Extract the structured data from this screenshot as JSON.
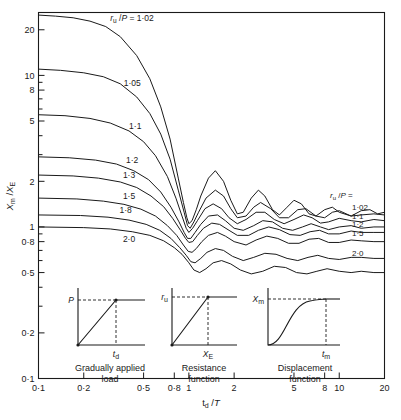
{
  "chart_data": {
    "type": "line",
    "title": "",
    "xlabel": "t_d /T",
    "ylabel": "X_m /X_E",
    "xscale": "log",
    "yscale": "log",
    "xlim": [
      0.1,
      20
    ],
    "ylim": [
      0.1,
      26
    ],
    "grid": false,
    "legend_position": "right",
    "legend_title": "r_u /P =",
    "xticks": [
      "0·1",
      "0·2",
      "0·5",
      "0·8",
      "1",
      "2",
      "5",
      "8",
      "10",
      "20"
    ],
    "xtick_values": [
      0.1,
      0.2,
      0.5,
      0.8,
      1,
      2,
      5,
      8,
      10,
      20
    ],
    "yticks": [
      "0·1",
      "0·2",
      "0·5",
      "0·8",
      "1",
      "2",
      "5",
      "8",
      "10",
      "20"
    ],
    "ytick_values": [
      0.1,
      0.2,
      0.5,
      0.8,
      1,
      2,
      5,
      8,
      10,
      20
    ],
    "series": [
      {
        "name": "1·02",
        "inner_label": "r_u /P = 1·02",
        "right_label": "1·02",
        "plateau": 1.25,
        "x": [
          0.1,
          0.13,
          0.17,
          0.22,
          0.28,
          0.35,
          0.45,
          0.55,
          0.65,
          0.75,
          0.85,
          0.92,
          0.97,
          1.0,
          1.05,
          1.12,
          1.2,
          1.35,
          1.5,
          1.7,
          1.9,
          2.1,
          2.3,
          2.6,
          2.9,
          3.2,
          3.6,
          4.0,
          4.5,
          5.0,
          5.6,
          6.3,
          7.0,
          8.0,
          9.0,
          10.0,
          12.0,
          14.0,
          16.0,
          18.0,
          20.0
        ],
        "y": [
          25.0,
          24.6,
          24.0,
          22.8,
          21.0,
          18.0,
          13.5,
          9.5,
          6.2,
          3.8,
          2.1,
          1.45,
          1.15,
          1.05,
          1.1,
          1.3,
          1.6,
          2.1,
          2.35,
          2.0,
          1.5,
          1.22,
          1.25,
          1.55,
          1.75,
          1.6,
          1.3,
          1.2,
          1.35,
          1.5,
          1.42,
          1.22,
          1.18,
          1.3,
          1.35,
          1.25,
          1.18,
          1.28,
          1.3,
          1.22,
          1.25
        ]
      },
      {
        "name": "1·05",
        "inner_label": "1·05",
        "right_label": "",
        "plateau": 1.2,
        "x": [
          0.1,
          0.14,
          0.2,
          0.27,
          0.35,
          0.45,
          0.55,
          0.65,
          0.75,
          0.85,
          0.93,
          0.98,
          1.02,
          1.08,
          1.16,
          1.3,
          1.5,
          1.7,
          1.9,
          2.1,
          2.4,
          2.7,
          3.0,
          3.5,
          4.0,
          4.6,
          5.3,
          6.0,
          7.0,
          8.0,
          9.0,
          10.0,
          12.0,
          14.0,
          17.0,
          20.0
        ],
        "y": [
          11.0,
          10.8,
          10.4,
          9.8,
          8.8,
          7.2,
          5.6,
          4.1,
          2.8,
          1.75,
          1.25,
          1.02,
          0.98,
          1.08,
          1.25,
          1.55,
          1.75,
          1.6,
          1.32,
          1.15,
          1.18,
          1.35,
          1.45,
          1.32,
          1.15,
          1.15,
          1.3,
          1.32,
          1.18,
          1.15,
          1.25,
          1.28,
          1.18,
          1.2,
          1.22,
          1.2
        ]
      },
      {
        "name": "1·1",
        "inner_label": "1·1",
        "right_label": "1·1",
        "plateau": 1.1,
        "x": [
          0.1,
          0.15,
          0.22,
          0.3,
          0.4,
          0.5,
          0.6,
          0.72,
          0.82,
          0.9,
          0.96,
          1.0,
          1.06,
          1.14,
          1.28,
          1.45,
          1.65,
          1.85,
          2.1,
          2.4,
          2.8,
          3.2,
          3.7,
          4.3,
          5.0,
          5.8,
          6.6,
          7.5,
          8.5,
          10.0,
          12.0,
          14.0,
          17.0,
          20.0
        ],
        "y": [
          5.5,
          5.42,
          5.2,
          4.85,
          4.3,
          3.65,
          2.95,
          2.15,
          1.55,
          1.18,
          0.98,
          0.92,
          0.98,
          1.1,
          1.32,
          1.42,
          1.32,
          1.15,
          1.05,
          1.12,
          1.25,
          1.25,
          1.12,
          1.05,
          1.12,
          1.2,
          1.15,
          1.06,
          1.08,
          1.14,
          1.1,
          1.08,
          1.12,
          1.1
        ]
      },
      {
        "name": "1·2",
        "inner_label": "1·2",
        "right_label": "1·2",
        "plateau": 1.0,
        "x": [
          0.1,
          0.16,
          0.24,
          0.33,
          0.43,
          0.54,
          0.65,
          0.76,
          0.86,
          0.93,
          0.98,
          1.03,
          1.1,
          1.2,
          1.35,
          1.55,
          1.75,
          2.0,
          2.3,
          2.7,
          3.1,
          3.6,
          4.2,
          4.9,
          5.7,
          6.5,
          7.5,
          8.5,
          10.0,
          12.0,
          14.0,
          17.0,
          20.0
        ],
        "y": [
          2.9,
          2.86,
          2.76,
          2.6,
          2.35,
          2.05,
          1.7,
          1.35,
          1.08,
          0.92,
          0.84,
          0.84,
          0.92,
          1.04,
          1.18,
          1.2,
          1.1,
          0.98,
          0.95,
          1.02,
          1.1,
          1.08,
          0.98,
          0.95,
          1.0,
          1.05,
          1.0,
          0.96,
          1.0,
          1.02,
          0.98,
          1.0,
          1.0
        ]
      },
      {
        "name": "1·3",
        "inner_label": "1·3",
        "right_label": "",
        "plateau": 0.92,
        "x": [
          0.1,
          0.17,
          0.25,
          0.35,
          0.45,
          0.56,
          0.68,
          0.78,
          0.88,
          0.95,
          1.0,
          1.06,
          1.14,
          1.25,
          1.42,
          1.6,
          1.85,
          2.1,
          2.5,
          2.9,
          3.4,
          4.0,
          4.7,
          5.5,
          6.4,
          7.4,
          8.5,
          10.0,
          12.0,
          14.0,
          17.0,
          20.0
        ],
        "y": [
          2.2,
          2.17,
          2.1,
          1.98,
          1.82,
          1.6,
          1.36,
          1.14,
          0.95,
          0.84,
          0.79,
          0.8,
          0.88,
          0.98,
          1.06,
          1.04,
          0.95,
          0.88,
          0.88,
          0.95,
          1.0,
          0.96,
          0.89,
          0.88,
          0.93,
          0.95,
          0.9,
          0.9,
          0.94,
          0.92,
          0.92,
          0.92
        ]
      },
      {
        "name": "1·5",
        "inner_label": "1·5",
        "right_label": "1·5",
        "plateau": 0.8,
        "x": [
          0.1,
          0.18,
          0.27,
          0.37,
          0.48,
          0.6,
          0.72,
          0.83,
          0.92,
          0.99,
          1.05,
          1.12,
          1.22,
          1.35,
          1.55,
          1.75,
          2.0,
          2.4,
          2.8,
          3.3,
          3.9,
          4.6,
          5.4,
          6.3,
          7.3,
          8.5,
          10.0,
          12.0,
          14.0,
          17.0,
          20.0
        ],
        "y": [
          1.55,
          1.53,
          1.48,
          1.41,
          1.31,
          1.18,
          1.02,
          0.88,
          0.76,
          0.69,
          0.68,
          0.72,
          0.8,
          0.88,
          0.92,
          0.87,
          0.8,
          0.76,
          0.82,
          0.87,
          0.84,
          0.78,
          0.78,
          0.83,
          0.84,
          0.79,
          0.79,
          0.82,
          0.81,
          0.8,
          0.8
        ]
      },
      {
        "name": "1·8",
        "inner_label": "1·8",
        "right_label": "",
        "plateau": 0.62,
        "x": [
          0.1,
          0.19,
          0.29,
          0.4,
          0.52,
          0.64,
          0.76,
          0.87,
          0.96,
          1.03,
          1.1,
          1.2,
          1.32,
          1.5,
          1.7,
          1.95,
          2.3,
          2.7,
          3.2,
          3.8,
          4.5,
          5.3,
          6.2,
          7.2,
          8.5,
          10.0,
          12.0,
          14.0,
          17.0,
          20.0
        ],
        "y": [
          1.2,
          1.19,
          1.16,
          1.11,
          1.04,
          0.95,
          0.84,
          0.73,
          0.65,
          0.59,
          0.58,
          0.62,
          0.68,
          0.72,
          0.7,
          0.64,
          0.6,
          0.63,
          0.67,
          0.66,
          0.62,
          0.6,
          0.63,
          0.65,
          0.62,
          0.61,
          0.63,
          0.63,
          0.62,
          0.62
        ]
      },
      {
        "name": "2·0",
        "inner_label": "2·0",
        "right_label": "2·0",
        "plateau": 0.5,
        "x": [
          0.1,
          0.2,
          0.3,
          0.42,
          0.55,
          0.68,
          0.8,
          0.9,
          1.0,
          1.08,
          1.18,
          1.3,
          1.45,
          1.65,
          1.9,
          2.2,
          2.6,
          3.1,
          3.7,
          4.4,
          5.2,
          6.1,
          7.1,
          8.3,
          10.0,
          12.0,
          14.0,
          17.0,
          20.0
        ],
        "y": [
          1.0,
          0.99,
          0.97,
          0.93,
          0.88,
          0.81,
          0.73,
          0.66,
          0.58,
          0.52,
          0.5,
          0.53,
          0.58,
          0.6,
          0.57,
          0.52,
          0.49,
          0.51,
          0.55,
          0.54,
          0.5,
          0.49,
          0.51,
          0.53,
          0.51,
          0.5,
          0.51,
          0.5,
          0.5
        ]
      }
    ]
  },
  "insets": [
    {
      "id": "gradually-applied-load",
      "caption_line1": "Gradually applied",
      "caption_line2": "load",
      "y_label": "P",
      "x_label": "t_d"
    },
    {
      "id": "resistance-function",
      "caption_line1": "Resistance",
      "caption_line2": "function",
      "y_label": "r_u",
      "x_label": "X_E"
    },
    {
      "id": "displacement-function",
      "caption_line1": "Displacement",
      "caption_line2": "function",
      "y_label": "X_m",
      "x_label": "t_m"
    }
  ],
  "figure": {
    "bottom_caption": ""
  }
}
